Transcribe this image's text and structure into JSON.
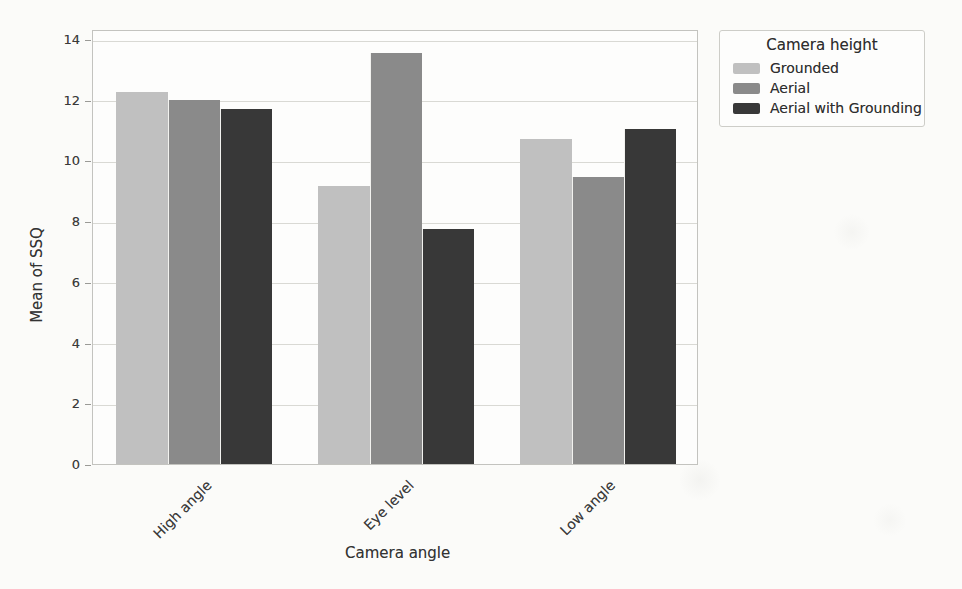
{
  "figure": {
    "xlabel": "Camera angle",
    "ylabel": "Mean of SSQ"
  },
  "legend": {
    "title": "Camera height",
    "items": [
      {
        "label": "Grounded",
        "color": "#c0c0c0"
      },
      {
        "label": "Aerial",
        "color": "#8a8a8a"
      },
      {
        "label": "Aerial with Grounding",
        "color": "#383838"
      }
    ]
  },
  "chart_data": {
    "type": "bar",
    "categories": [
      "High angle",
      "Eye level",
      "Low angle"
    ],
    "series": [
      {
        "name": "Grounded",
        "color": "#c0c0c0",
        "values": [
          12.25,
          9.15,
          10.7
        ]
      },
      {
        "name": "Aerial",
        "color": "#8a8a8a",
        "values": [
          12.0,
          13.55,
          9.45
        ]
      },
      {
        "name": "Aerial with Grounding",
        "color": "#383838",
        "values": [
          11.7,
          7.75,
          11.05
        ]
      }
    ],
    "title": "",
    "xlabel": "Camera angle",
    "ylabel": "Mean of SSQ",
    "ylim": [
      0,
      14
    ],
    "yticks": [
      0,
      2,
      4,
      6,
      8,
      10,
      12,
      14
    ],
    "grid": true,
    "grid_axis": "y",
    "legend_title": "Camera height",
    "legend_position": "outside upper right"
  }
}
